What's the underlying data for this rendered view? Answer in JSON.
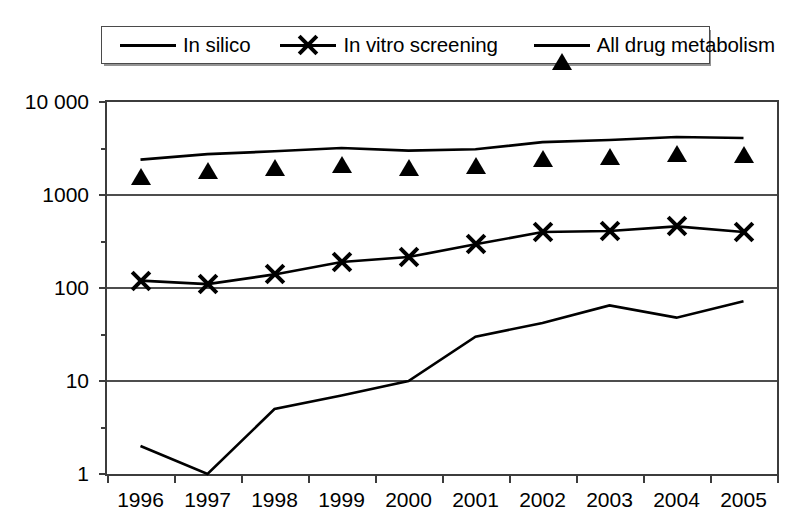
{
  "chart_data": {
    "type": "line",
    "title": "",
    "xlabel": "",
    "ylabel": "",
    "yscale": "log",
    "ylim": [
      1,
      10000
    ],
    "grid": true,
    "legend_position": "top",
    "ytick_labels": [
      "10 000",
      "1000",
      "100",
      "10",
      "1"
    ],
    "ytick_values": [
      10000,
      1000,
      100,
      10,
      1
    ],
    "categories": [
      "1996",
      "1997",
      "1998",
      "1999",
      "2000",
      "2001",
      "2002",
      "2003",
      "2004",
      "2005"
    ],
    "series": [
      {
        "name": "In silico",
        "marker": "diamond",
        "marker_color": "#000000",
        "line_color": "#000000",
        "values": [
          2,
          1,
          5,
          7,
          10,
          30,
          42,
          65,
          48,
          72
        ]
      },
      {
        "name": "In vitro screening",
        "marker": "cross",
        "marker_color": "#9a9a9a",
        "line_color": "#000000",
        "values": [
          120,
          110,
          140,
          190,
          215,
          295,
          400,
          410,
          460,
          400
        ]
      },
      {
        "name": "All drug metabolism",
        "marker": "triangle",
        "marker_color": "#000000",
        "line_color": "#000000",
        "values": [
          2400,
          2750,
          2950,
          3200,
          3000,
          3100,
          3700,
          3900,
          4200,
          4100
        ]
      }
    ]
  },
  "legend": {
    "items": [
      {
        "label": "In silico",
        "marker": "diamond-marker-icon"
      },
      {
        "label": "In vitro screening",
        "marker": "cross-marker-icon"
      },
      {
        "label": "All drug metabolism",
        "marker": "triangle-marker-icon"
      }
    ]
  }
}
